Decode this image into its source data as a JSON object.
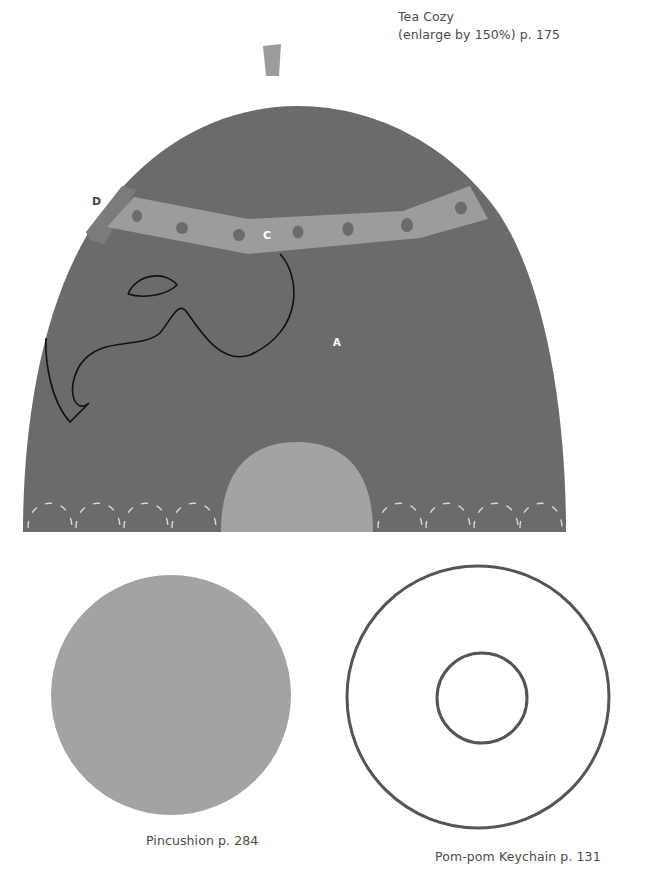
{
  "page": {
    "background": "#ffffff"
  },
  "tea_cozy": {
    "title": "Tea Cozy",
    "subtitle": "(enlarge by 150%) p. 175",
    "pieces": {
      "A": "A",
      "B": "B",
      "C": "C",
      "D": "D"
    },
    "colors": {
      "body": "#6b6b6b",
      "band": "#9c9c9c",
      "band_dots": "#6b6b6b",
      "tab": "#9c9c9c",
      "side_strip": "#7b7b7b",
      "arch": "#a3a3a3",
      "outline": "#111111",
      "stitches": "#d8d8d8"
    }
  },
  "pincushion": {
    "caption": "Pincushion p. 284",
    "color": "#a3a3a3"
  },
  "pompom_keychain": {
    "caption": "Pom-pom Keychain p. 131",
    "ring_color": "#555555"
  }
}
